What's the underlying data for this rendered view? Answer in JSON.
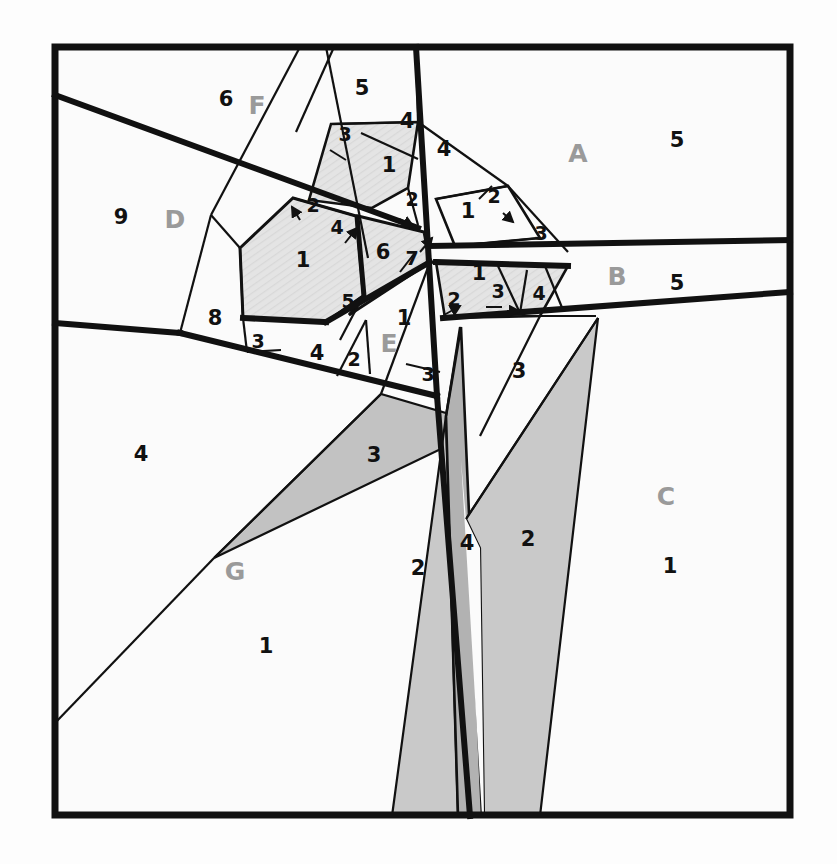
{
  "figure": {
    "frame": {
      "x": 55,
      "y": 47,
      "width": 735,
      "height": 768
    },
    "colors": {
      "background": "#fdfdfd",
      "stroke": "#111111",
      "region_light": "#fafafa",
      "hatch_light": "#e2e2e2",
      "gray_mid": "#c6c6c6",
      "gray_dark": "#b2b2b2",
      "number_color": "#111111",
      "letter_color": "#9a9a9a"
    },
    "stroke_widths": {
      "frame": 7,
      "heavy": 6,
      "medium": 3.2,
      "thin": 2
    }
  },
  "letter_labels": [
    {
      "text": "A",
      "x": 578,
      "y": 162
    },
    {
      "text": "B",
      "x": 617,
      "y": 285
    },
    {
      "text": "C",
      "x": 666,
      "y": 505
    },
    {
      "text": "D",
      "x": 175,
      "y": 228
    },
    {
      "text": "E",
      "x": 389,
      "y": 352
    },
    {
      "text": "F",
      "x": 257,
      "y": 114
    },
    {
      "text": "G",
      "x": 235,
      "y": 580
    }
  ],
  "number_labels": [
    {
      "text": "5",
      "x": 362,
      "y": 95,
      "size": "normal"
    },
    {
      "text": "6",
      "x": 226,
      "y": 106,
      "size": "normal"
    },
    {
      "text": "5",
      "x": 677,
      "y": 147,
      "size": "normal"
    },
    {
      "text": "5",
      "x": 677,
      "y": 290,
      "size": "normal"
    },
    {
      "text": "9",
      "x": 121,
      "y": 224,
      "size": "normal"
    },
    {
      "text": "3",
      "x": 345,
      "y": 141,
      "size": "small"
    },
    {
      "text": "4",
      "x": 407,
      "y": 128,
      "size": "normal"
    },
    {
      "text": "4",
      "x": 444,
      "y": 156,
      "size": "normal"
    },
    {
      "text": "1",
      "x": 389,
      "y": 172,
      "size": "normal"
    },
    {
      "text": "2",
      "x": 412,
      "y": 206,
      "size": "small"
    },
    {
      "text": "2",
      "x": 494,
      "y": 203,
      "size": "small"
    },
    {
      "text": "1",
      "x": 468,
      "y": 218,
      "size": "normal"
    },
    {
      "text": "3",
      "x": 541,
      "y": 240,
      "size": "small"
    },
    {
      "text": "2",
      "x": 313,
      "y": 212,
      "size": "small"
    },
    {
      "text": "4",
      "x": 337,
      "y": 234,
      "size": "small"
    },
    {
      "text": "1",
      "x": 303,
      "y": 267,
      "size": "normal"
    },
    {
      "text": "6",
      "x": 383,
      "y": 259,
      "size": "normal"
    },
    {
      "text": "7",
      "x": 412,
      "y": 265,
      "size": "small"
    },
    {
      "text": "1",
      "x": 479,
      "y": 280,
      "size": "normal"
    },
    {
      "text": "5",
      "x": 348,
      "y": 308,
      "size": "small"
    },
    {
      "text": "2",
      "x": 454,
      "y": 306,
      "size": "small"
    },
    {
      "text": "3",
      "x": 498,
      "y": 298,
      "size": "small"
    },
    {
      "text": "4",
      "x": 539,
      "y": 300,
      "size": "small"
    },
    {
      "text": "8",
      "x": 215,
      "y": 325,
      "size": "normal"
    },
    {
      "text": "3",
      "x": 258,
      "y": 348,
      "size": "small"
    },
    {
      "text": "4",
      "x": 317,
      "y": 360,
      "size": "normal"
    },
    {
      "text": "2",
      "x": 354,
      "y": 366,
      "size": "small"
    },
    {
      "text": "1",
      "x": 404,
      "y": 325,
      "size": "normal"
    },
    {
      "text": "3",
      "x": 428,
      "y": 381,
      "size": "small"
    },
    {
      "text": "3",
      "x": 519,
      "y": 378,
      "size": "normal"
    },
    {
      "text": "3",
      "x": 374,
      "y": 462,
      "size": "normal"
    },
    {
      "text": "4",
      "x": 141,
      "y": 461,
      "size": "normal"
    },
    {
      "text": "1",
      "x": 266,
      "y": 653,
      "size": "normal"
    },
    {
      "text": "2",
      "x": 418,
      "y": 575,
      "size": "normal"
    },
    {
      "text": "4",
      "x": 467,
      "y": 550,
      "size": "normal"
    },
    {
      "text": "2",
      "x": 528,
      "y": 546,
      "size": "normal"
    },
    {
      "text": "1",
      "x": 670,
      "y": 573,
      "size": "normal"
    }
  ],
  "regions": [
    {
      "name": "region-F-top",
      "fill": "region_light"
    },
    {
      "name": "region-D-left",
      "fill": "region_light"
    },
    {
      "name": "region-A-right",
      "fill": "region_light"
    },
    {
      "name": "region-B-band",
      "fill": "region_light"
    },
    {
      "name": "region-C-lower",
      "fill": "region_light"
    },
    {
      "name": "region-G-lower",
      "fill": "region_light"
    },
    {
      "name": "hatched-pentagon-1",
      "fill": "hatch_light"
    },
    {
      "name": "hatched-quad-6",
      "fill": "hatch_light"
    },
    {
      "name": "hatched-quad-1b",
      "fill": "hatch_light"
    },
    {
      "name": "wedge-3-gray",
      "fill": "gray_mid"
    },
    {
      "name": "wedge-2-left",
      "fill": "gray_mid"
    },
    {
      "name": "wedge-4-strip",
      "fill": "gray_dark"
    },
    {
      "name": "wedge-2-right",
      "fill": "gray_mid"
    }
  ]
}
